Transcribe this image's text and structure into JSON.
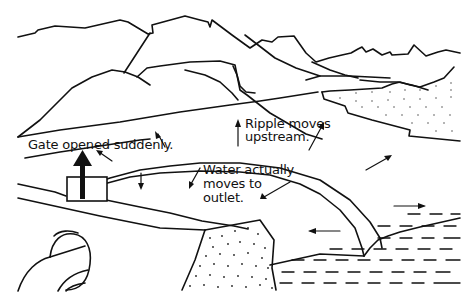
{
  "diagram": {
    "type": "illustration",
    "labels": {
      "gate": "Gate opened suddenly.",
      "ripple_line1": "Ripple moves",
      "ripple_line2": "upstream.",
      "water_line1": "Water actually",
      "water_line2": "moves to",
      "water_line3": "outlet."
    },
    "elements": [
      "mountain-range",
      "canal-channel",
      "gate",
      "gate-lift-arrow",
      "ripple-wave-crest",
      "flow-arrows",
      "dotted-bank",
      "sandy-plateau",
      "reservoir-water",
      "outlet-pipe"
    ],
    "colors": {
      "ink": "#111111",
      "background": "#ffffff"
    }
  }
}
